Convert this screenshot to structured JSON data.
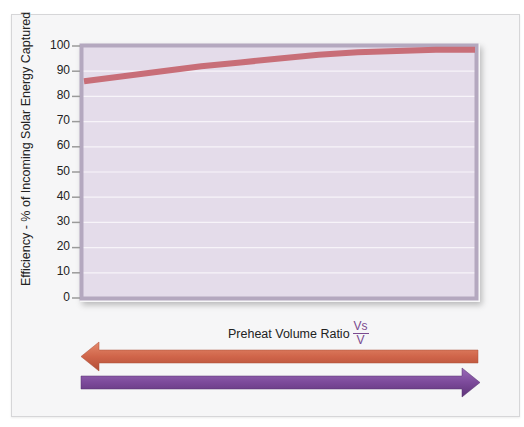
{
  "chart_data": {
    "type": "line",
    "title": "",
    "xlabel": "Preheat Volume Ratio",
    "xlabel_fraction": {
      "numerator": "Vs",
      "denominator": "V"
    },
    "ylabel": "Efficiency - % of Incoming Solar Energy Captured",
    "ylim": [
      0,
      100
    ],
    "yticks": [
      0,
      10,
      20,
      30,
      40,
      50,
      60,
      70,
      80,
      90,
      100
    ],
    "grid": true,
    "x_ticks_shown": false,
    "series": [
      {
        "name": "Efficiency",
        "color": "#c86e78",
        "x": [
          0,
          0.1,
          0.2,
          0.3,
          0.4,
          0.5,
          0.6,
          0.7,
          0.8,
          0.9,
          1.0
        ],
        "values": [
          86,
          88,
          90,
          92,
          93.5,
          95,
          96.5,
          97.5,
          98,
          98.5,
          98.5
        ]
      }
    ],
    "annotations": [
      {
        "type": "arrow",
        "direction": "left",
        "color": "#d0654a"
      },
      {
        "type": "arrow",
        "direction": "right",
        "color": "#7c4a9a"
      }
    ]
  },
  "axis": {
    "y_label": "Efficiency - % of Incoming Solar Energy Captured",
    "y_ticks": [
      "100",
      "90",
      "80",
      "70",
      "60",
      "50",
      "40",
      "30",
      "20",
      "10",
      "0"
    ],
    "x_label": "Preheat Volume Ratio",
    "x_frac_num": "Vs",
    "x_frac_den": "V"
  },
  "colors": {
    "plot_bg": "#e4dcea",
    "frame": "#b4a8bf",
    "line": "#c86e78",
    "arrow_left": "#d0654a",
    "arrow_right": "#7c4a9a"
  }
}
